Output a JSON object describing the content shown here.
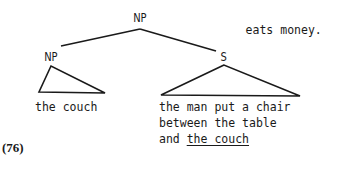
{
  "diagram": {
    "type": "syntax-tree",
    "nodes": {
      "root": "NP",
      "left_np": "NP",
      "right_s": "S"
    },
    "leaves": {
      "left": "the couch",
      "right_lines": [
        "the man put a chair",
        "between the table",
        "and "
      ],
      "right_underlined": "the couch"
    },
    "continuation": "eats money.",
    "example_number": "(76)"
  }
}
